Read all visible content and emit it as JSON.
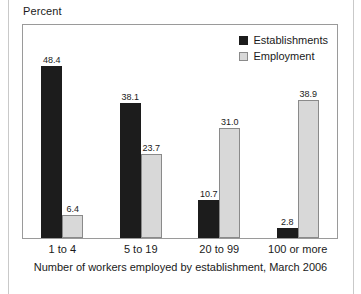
{
  "chart_data": {
    "type": "bar",
    "title": "",
    "ylabel": "Percent",
    "xlabel": "Number of workers employed by establishment, March 2006",
    "categories": [
      "1 to 4",
      "5 to 19",
      "20 to 99",
      "100 or more"
    ],
    "series": [
      {
        "name": "Establishments",
        "color": "#1c1c1c",
        "values": [
          48.4,
          38.1,
          10.7,
          2.8
        ],
        "labels": [
          "48.4",
          "38.1",
          "10.7",
          "2.8"
        ]
      },
      {
        "name": "Employment",
        "color": "#d8d8d8",
        "values": [
          6.4,
          23.7,
          31.0,
          38.9
        ],
        "labels": [
          "6.4",
          "23.7",
          "31.0",
          "38.9"
        ]
      }
    ],
    "ylim": [
      0,
      60
    ],
    "grid": false,
    "legend_position": "top-right",
    "yticks_visible": false
  },
  "legend": {
    "items": [
      {
        "label": "Establishments",
        "swatch": "dark-square-swatch"
      },
      {
        "label": "Employment",
        "swatch": "light-square-swatch"
      }
    ]
  },
  "colors": {
    "establishments": "#1c1c1c",
    "employment": "#d8d8d8",
    "frame": "#9a9a9a",
    "text": "#1a1a1a",
    "page_rule": "#c9c9c9"
  }
}
